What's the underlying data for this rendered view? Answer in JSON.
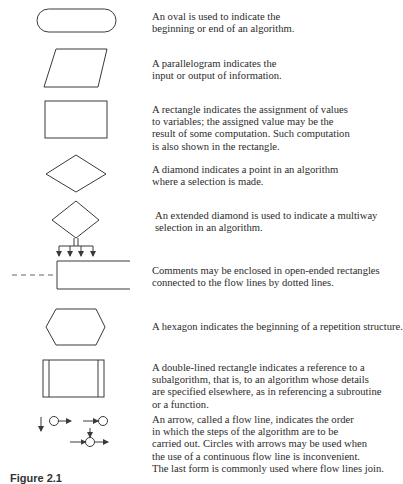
{
  "figure": {
    "caption": "Figure 2.1",
    "stroke_color": "#3a3a3a",
    "text_color": "#2b2b2b",
    "entries": [
      {
        "symbol": "oval",
        "lines": [
          "An oval is used to indicate the",
          "beginning or end of an algorithm."
        ]
      },
      {
        "symbol": "parallelogram",
        "lines": [
          "A parallelogram indicates the",
          "input or output of information."
        ]
      },
      {
        "symbol": "rectangle",
        "lines": [
          "A rectangle indicates the assignment of values",
          "to variables; the assigned value may be the",
          "result of some computation. Such computation",
          "is also shown in the rectangle."
        ]
      },
      {
        "symbol": "diamond",
        "lines": [
          "A diamond indicates a point in an algorithm",
          "where a selection is made."
        ]
      },
      {
        "symbol": "extended-diamond",
        "lines": [
          "An extended diamond is used to indicate a multiway",
          "selection in an algorithm."
        ]
      },
      {
        "symbol": "open-ended-rectangle",
        "lines": [
          "Comments may be enclosed in open-ended rectangles",
          "connected to the flow lines by dotted lines."
        ]
      },
      {
        "symbol": "hexagon",
        "lines": [
          "A hexagon indicates the beginning of a repetition structure."
        ]
      },
      {
        "symbol": "double-lined-rectangle",
        "lines": [
          "A double-lined rectangle indicates a reference to a",
          "subalgorithm, that is, to an algorithm whose details",
          "are specified elsewhere, as in referencing a subroutine",
          "or a function."
        ]
      },
      {
        "symbol": "flow-line-arrows",
        "lines": [
          "An arrow, called a flow line, indicates the order",
          "in which the steps of the algorithm are to be",
          "carried out. Circles with arrows may be used when",
          "the use of a continuous flow line is inconvenient.",
          "The last form is commonly used where flow lines join."
        ]
      }
    ]
  }
}
